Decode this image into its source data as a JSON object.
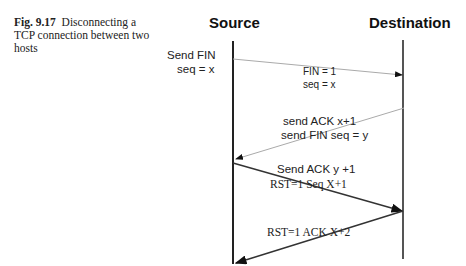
{
  "caption": {
    "label": "Fig. 9.17",
    "text": "Disconnecting a TCP connection between two hosts"
  },
  "hosts": {
    "source": "Source",
    "destination": "Destination"
  },
  "messages": [
    {
      "side_label_1": "Send FIN",
      "side_label_2": "seq = x",
      "line_label_1": "FIN = 1",
      "line_label_2": "seq = x",
      "direction": "source-to-destination",
      "color": "#aaaaaa"
    },
    {
      "line_label_1": "send ACK x+1",
      "line_label_2": "send FIN seq = y",
      "direction": "destination-to-source",
      "color": "#aaaaaa"
    },
    {
      "line_label_1": "Send ACK  y +1",
      "line_label_2": "RST=1 Seq X+1",
      "direction": "source-to-destination",
      "color": "#333333"
    },
    {
      "line_label_1": "RST=1 ACK X+2",
      "direction": "destination-to-source",
      "color": "#333333"
    }
  ]
}
